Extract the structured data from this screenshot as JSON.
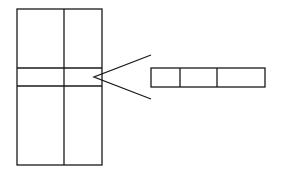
{
  "diagram": {
    "colors": {
      "stroke": "#1a1a1a",
      "background": "#ffffff"
    },
    "source_table": {
      "columns": 2,
      "highlighted_row": "middle band"
    },
    "connector": {
      "type": "open-angle (magnify / expand)",
      "points_from": "target_record",
      "points_to": "source_table.highlighted_row"
    },
    "target_record": {
      "cells": 3
    }
  }
}
